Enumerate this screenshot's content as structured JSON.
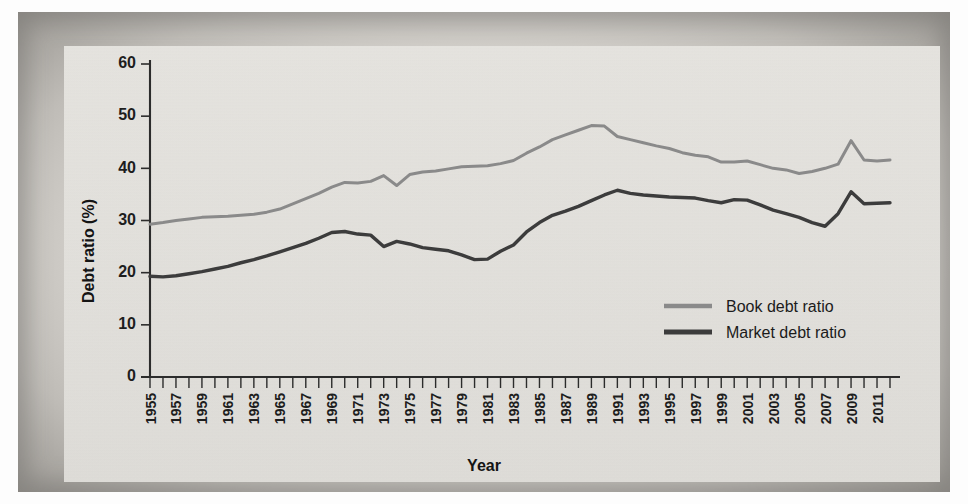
{
  "figure": {
    "background_color": "#e3e1dc",
    "frame_color": "#a8a5a0"
  },
  "chart_data": {
    "type": "line",
    "title": "",
    "xlabel": "Year",
    "ylabel": "Debt ratio (%)",
    "xlim": [
      1955,
      2012
    ],
    "ylim": [
      0,
      60
    ],
    "yticks": [
      0,
      10,
      20,
      30,
      40,
      50,
      60
    ],
    "xticks": [
      1955,
      1957,
      1959,
      1961,
      1963,
      1965,
      1967,
      1969,
      1971,
      1973,
      1975,
      1977,
      1979,
      1981,
      1983,
      1985,
      1987,
      1989,
      1991,
      1993,
      1995,
      1997,
      1999,
      2001,
      2003,
      2005,
      2007,
      2009,
      2011
    ],
    "xtick_minor_step": 1,
    "grid": false,
    "legend_position": "center-right",
    "x": [
      1955,
      1956,
      1957,
      1958,
      1959,
      1960,
      1961,
      1962,
      1963,
      1964,
      1965,
      1966,
      1967,
      1968,
      1969,
      1970,
      1971,
      1972,
      1973,
      1974,
      1975,
      1976,
      1977,
      1978,
      1979,
      1980,
      1981,
      1982,
      1983,
      1984,
      1985,
      1986,
      1987,
      1988,
      1989,
      1990,
      1991,
      1992,
      1993,
      1994,
      1995,
      1996,
      1997,
      1998,
      1999,
      2000,
      2001,
      2002,
      2003,
      2004,
      2005,
      2006,
      2007,
      2008,
      2009,
      2010,
      2011,
      2012
    ],
    "series": [
      {
        "name": "Book debt ratio",
        "color": "#8a8a8a",
        "linewidth": 3.0,
        "values": [
          29.3,
          29.6,
          30.0,
          30.3,
          30.6,
          30.7,
          30.8,
          31.0,
          31.2,
          31.6,
          32.2,
          33.2,
          34.2,
          35.2,
          36.4,
          37.3,
          37.2,
          37.5,
          38.6,
          36.7,
          38.8,
          39.3,
          39.5,
          39.9,
          40.3,
          40.4,
          40.5,
          40.9,
          41.5,
          42.9,
          44.1,
          45.5,
          46.4,
          47.3,
          48.2,
          48.1,
          46.1,
          45.5,
          44.9,
          44.3,
          43.8,
          43.0,
          42.5,
          42.2,
          41.2,
          41.2,
          41.4,
          40.7,
          40.0,
          39.7,
          39.0,
          39.4,
          40.0,
          40.8,
          45.3,
          41.6,
          41.4,
          41.6
        ]
      },
      {
        "name": "Market debt ratio",
        "color": "#3c3c3c",
        "linewidth": 3.4,
        "values": [
          19.3,
          19.2,
          19.4,
          19.8,
          20.2,
          20.7,
          21.2,
          21.9,
          22.5,
          23.2,
          24.0,
          24.8,
          25.6,
          26.6,
          27.7,
          27.9,
          27.4,
          27.2,
          25.0,
          26.0,
          25.5,
          24.8,
          24.5,
          24.2,
          23.4,
          22.5,
          22.6,
          24.1,
          25.3,
          27.8,
          29.6,
          31.0,
          31.8,
          32.7,
          33.8,
          34.9,
          35.8,
          35.2,
          34.9,
          34.7,
          34.5,
          34.4,
          34.3,
          33.8,
          33.4,
          34.0,
          33.9,
          33.0,
          32.0,
          31.3,
          30.6,
          29.6,
          28.9,
          31.3,
          35.5,
          33.2,
          33.3,
          33.4
        ]
      }
    ]
  },
  "legend": {
    "entries": [
      {
        "label": "Book debt ratio",
        "color": "#8a8a8a"
      },
      {
        "label": "Market debt ratio",
        "color": "#3c3c3c"
      }
    ]
  }
}
